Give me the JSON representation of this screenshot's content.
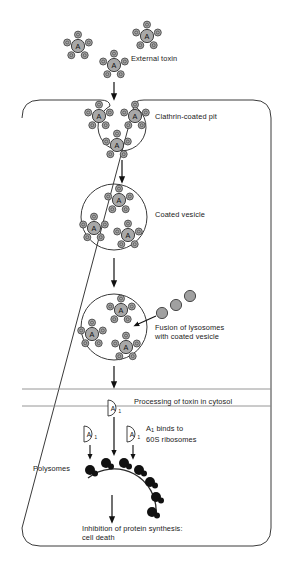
{
  "figure": {
    "type": "biological-pathway-diagram",
    "background_color": "#ffffff",
    "stroke_color": "#222222",
    "toxin_fill": "#a8a8a8",
    "lysosome_fill": "#a0a0a0",
    "ribosome_fill": "#111111"
  },
  "labels": {
    "external_toxin": "External toxin",
    "clathrin_coated_pit": "Clathrin-coated pit",
    "coated_vesicle": "Coated vesicle",
    "fusion_line1": "Fusion of lysosomes",
    "fusion_line2": "with coated vesicle",
    "processing": "Processing of toxin in cytosol",
    "binds_line1_pre": "A",
    "binds_line1_sub": "1",
    "binds_line1_post": " binds to",
    "binds_line2": "60S ribosomes",
    "polysomes": "Polysomes",
    "outcome_line1": "Inhibition of protein synthesis:",
    "outcome_line2": "cell death"
  },
  "molecule_letters": {
    "a_subunit": "A",
    "a1_fragment_letter": "A",
    "a1_fragment_sub": "1"
  },
  "steps": [
    {
      "id": "external-toxin",
      "label": "External toxin"
    },
    {
      "id": "clathrin-coated-pit",
      "label": "Clathrin-coated pit"
    },
    {
      "id": "coated-vesicle",
      "label": "Coated vesicle"
    },
    {
      "id": "lysosome-fusion",
      "label": "Fusion of lysosomes with coated vesicle"
    },
    {
      "id": "toxin-processing",
      "label": "Processing of toxin in cytosol"
    },
    {
      "id": "ribosome-binding",
      "label": "A1 binds to 60S ribosomes"
    },
    {
      "id": "cell-death",
      "label": "Inhibition of protein synthesis: cell death"
    }
  ],
  "counts": {
    "external_toxins": 3,
    "toxins_in_pit": 3,
    "toxins_in_vesicle": 3,
    "toxins_in_fused_vesicle": 3,
    "lysosomes": 3,
    "a1_fragments": 3,
    "ribosomes_on_polysome": 7,
    "b_subunits_per_toxin": 5
  }
}
